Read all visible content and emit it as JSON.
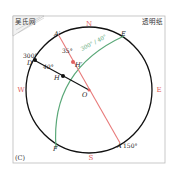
{
  "figure": {
    "panel_label": "(C)",
    "top_left_label": "吴氏网",
    "top_right_label": "透明纸",
    "compass": {
      "north": "N",
      "south": "S",
      "west": "W",
      "east": "E"
    },
    "points": {
      "A_prime": "A′",
      "A": "A",
      "E": "E",
      "F": "F",
      "D": "D",
      "H": "H",
      "H_prime": "H′",
      "O": "O"
    },
    "annotations": {
      "angle_D": "300°",
      "angle_DO": "40°",
      "angle_red": "35°",
      "great_circle": "300° / 40°",
      "angle_A": "150°"
    },
    "colors": {
      "circle": "#111111",
      "compass": "#e06060",
      "red_line": "#e87a7a",
      "green_arc": "#5aa878",
      "frame": "#bbbbbb"
    }
  }
}
